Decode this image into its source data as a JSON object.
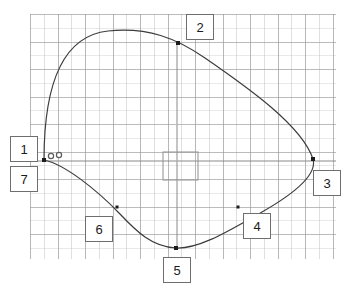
{
  "viewport": {
    "width": 346,
    "height": 291,
    "background_color": "#ffffff"
  },
  "grid": {
    "visible": true,
    "left": 30,
    "top": 14,
    "width": 306,
    "height": 245,
    "minor_spacing_px": 13.75,
    "major_spacing_px": 27.5,
    "minor_color": "#b5b5b5",
    "major_color": "#969696",
    "style": "dotted"
  },
  "axes": {
    "horizontal": {
      "visible": true,
      "y": 161,
      "x_start": 31,
      "x_end": 336,
      "color": "#8a8a8a"
    },
    "vertical": {
      "visible": true,
      "x": 177,
      "y_start": 43,
      "y_end": 249,
      "color": "#8a8a8a"
    }
  },
  "curve": {
    "type": "closed-spline",
    "stroke_color": "#3c3c3c",
    "stroke_width": 1.2,
    "fill": "none",
    "path": "M 44 160 C 44 84, 62 36, 108 31 C 148 27, 176 38, 205 58 C 250 89, 302 126, 313 159 C 318 176, 290 196, 262 212 C 230 230, 200 249, 176 248 C 152 247, 136 231, 120 214 C 96 189, 64 164, 44 160 Z"
  },
  "nodes": [
    {
      "id": "1",
      "label": "1",
      "x": 44,
      "y": 160,
      "marker": "square",
      "size": 4
    },
    {
      "id": "2",
      "label": "2",
      "x": 178,
      "y": 43,
      "marker": "square",
      "size": 4
    },
    {
      "id": "3",
      "label": "3",
      "x": 313,
      "y": 159,
      "marker": "square",
      "size": 4
    },
    {
      "id": "4",
      "label": "4",
      "x": 238,
      "y": 207,
      "marker": "square",
      "size": 3
    },
    {
      "id": "5",
      "label": "5",
      "x": 176,
      "y": 248,
      "marker": "square",
      "size": 4
    },
    {
      "id": "6",
      "label": "6",
      "x": 117,
      "y": 207,
      "marker": "square",
      "size": 3
    },
    {
      "id": "7",
      "label": "7",
      "x": 44,
      "y": 160,
      "marker": "square",
      "size": 4
    }
  ],
  "handles": [
    {
      "name": "handle-a",
      "x": 51,
      "y": 156,
      "r": 2.6,
      "stroke": "#5a5a5a"
    },
    {
      "name": "handle-b",
      "x": 59,
      "y": 155,
      "r": 2.6,
      "stroke": "#5a5a5a"
    }
  ],
  "selection_box": {
    "visible": true,
    "x": 163,
    "y": 152,
    "width": 35,
    "height": 28,
    "stroke": "#999999",
    "fill": "none"
  },
  "callouts": [
    {
      "label": "1",
      "x": 10,
      "y": 136,
      "w": 28,
      "h": 26
    },
    {
      "label": "7",
      "x": 10,
      "y": 166,
      "w": 28,
      "h": 26
    },
    {
      "label": "2",
      "x": 186,
      "y": 14,
      "w": 28,
      "h": 26
    },
    {
      "label": "3",
      "x": 313,
      "y": 170,
      "w": 28,
      "h": 26
    },
    {
      "label": "4",
      "x": 243,
      "y": 213,
      "w": 28,
      "h": 26
    },
    {
      "label": "5",
      "x": 163,
      "y": 257,
      "w": 28,
      "h": 26
    },
    {
      "label": "6",
      "x": 85,
      "y": 216,
      "w": 28,
      "h": 26
    }
  ],
  "center_dots": [
    {
      "x": 177,
      "y": 125,
      "color": "#c0c0c0"
    },
    {
      "x": 213,
      "y": 161,
      "color": "#c9c9c9"
    },
    {
      "x": 177,
      "y": 161,
      "color": "#b8b8b8"
    }
  ]
}
